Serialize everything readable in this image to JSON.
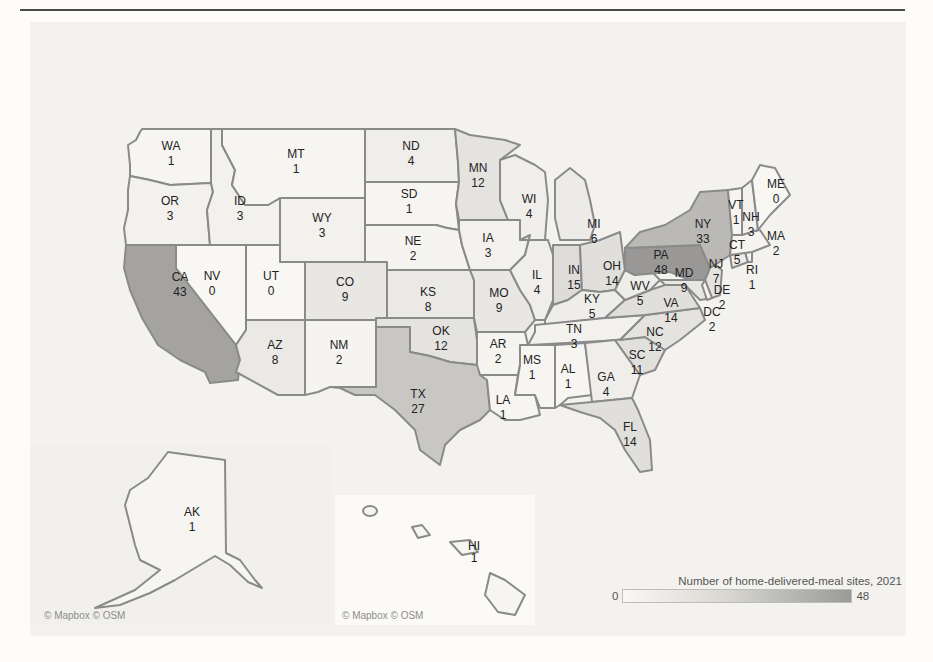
{
  "map": {
    "title_legend": "Number of home-delivered-meal sites, 2021",
    "legend": {
      "min": "0",
      "max": "48",
      "color_low": "#f9f8f4",
      "color_high": "#9a9a97"
    },
    "credits": {
      "left": "© Mapbox © OSM",
      "inset": "© Mapbox © OSM"
    }
  },
  "states": {
    "WA": {
      "label": "WA",
      "value": "1"
    },
    "OR": {
      "label": "OR",
      "value": "3"
    },
    "CA": {
      "label": "CA",
      "value": "43"
    },
    "ID": {
      "label": "ID",
      "value": "3"
    },
    "NV": {
      "label": "NV",
      "value": "0"
    },
    "MT": {
      "label": "MT",
      "value": "1"
    },
    "WY": {
      "label": "WY",
      "value": "3"
    },
    "UT": {
      "label": "UT",
      "value": "0"
    },
    "AZ": {
      "label": "AZ",
      "value": "8"
    },
    "CO": {
      "label": "CO",
      "value": "9"
    },
    "NM": {
      "label": "NM",
      "value": "2"
    },
    "ND": {
      "label": "ND",
      "value": "4"
    },
    "SD": {
      "label": "SD",
      "value": "1"
    },
    "NE": {
      "label": "NE",
      "value": "2"
    },
    "KS": {
      "label": "KS",
      "value": "8"
    },
    "OK": {
      "label": "OK",
      "value": "12"
    },
    "TX": {
      "label": "TX",
      "value": "27"
    },
    "MN": {
      "label": "MN",
      "value": "12"
    },
    "IA": {
      "label": "IA",
      "value": "3"
    },
    "MO": {
      "label": "MO",
      "value": "9"
    },
    "AR": {
      "label": "AR",
      "value": "2"
    },
    "LA": {
      "label": "LA",
      "value": "1"
    },
    "WI": {
      "label": "WI",
      "value": "4"
    },
    "IL": {
      "label": "IL",
      "value": "4"
    },
    "MI": {
      "label": "MI",
      "value": "6"
    },
    "IN": {
      "label": "IN",
      "value": "15"
    },
    "OH": {
      "label": "OH",
      "value": "14"
    },
    "KY": {
      "label": "KY",
      "value": "5"
    },
    "TN": {
      "label": "TN",
      "value": "3"
    },
    "MS": {
      "label": "MS",
      "value": "1"
    },
    "AL": {
      "label": "AL",
      "value": "1"
    },
    "GA": {
      "label": "GA",
      "value": "4"
    },
    "FL": {
      "label": "FL",
      "value": "14"
    },
    "SC": {
      "label": "SC",
      "value": "11"
    },
    "NC": {
      "label": "NC",
      "value": "12"
    },
    "VA": {
      "label": "VA",
      "value": "14"
    },
    "WV": {
      "label": "WV",
      "value": "5"
    },
    "PA": {
      "label": "PA",
      "value": "48"
    },
    "NY": {
      "label": "NY",
      "value": "33"
    },
    "MD": {
      "label": "MD",
      "value": "9"
    },
    "DE": {
      "label": "DE",
      "value": "2"
    },
    "DC": {
      "label": "DC",
      "value": "2"
    },
    "NJ": {
      "label": "NJ",
      "value": "7"
    },
    "CT": {
      "label": "CT",
      "value": "5"
    },
    "RI": {
      "label": "RI",
      "value": "1"
    },
    "MA": {
      "label": "MA",
      "value": "2"
    },
    "VT": {
      "label": "VT",
      "value": "1"
    },
    "NH": {
      "label": "NH",
      "value": "3"
    },
    "ME": {
      "label": "ME",
      "value": "0"
    },
    "AK": {
      "label": "AK",
      "value": "1"
    },
    "HI": {
      "label": "HI",
      "value": "1"
    }
  },
  "fills": {
    "v0": "#f8f7f3",
    "v1": "#f6f5f1",
    "v3": "#f2f1ed",
    "v5": "#eeedea",
    "v9": "#e8e7e3",
    "v12": "#e4e3df",
    "v15": "#dddcd8",
    "v27": "#c8c7c3",
    "v33": "#bab9b6",
    "v43": "#a4a3a0",
    "v48": "#999896"
  }
}
